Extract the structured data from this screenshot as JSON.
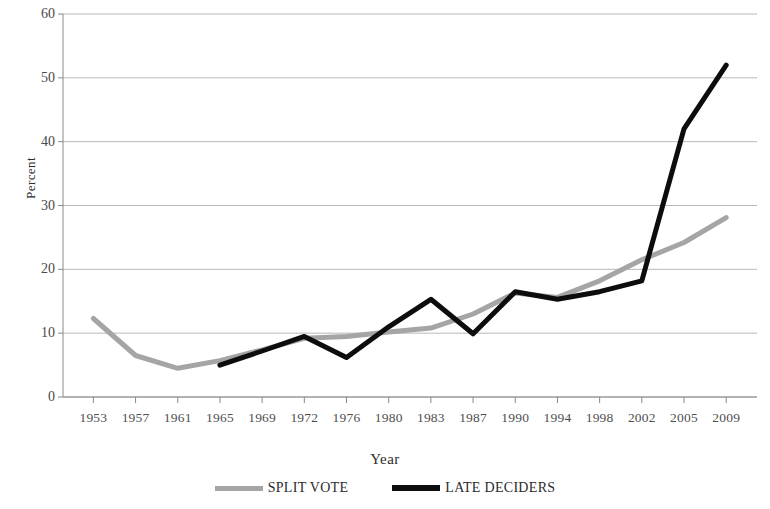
{
  "chart_data": {
    "type": "line",
    "title": "",
    "xlabel": "Year",
    "ylabel": "Percent",
    "ylim": [
      0,
      60
    ],
    "yticks": [
      0,
      10,
      20,
      30,
      40,
      50,
      60
    ],
    "grid": true,
    "legend_position": "bottom",
    "categories": [
      "1953",
      "1957",
      "1961",
      "1965",
      "1969",
      "1972",
      "1976",
      "1980",
      "1983",
      "1987",
      "1990",
      "1994",
      "1998",
      "2002",
      "2005",
      "2009"
    ],
    "series": [
      {
        "name": "SPLIT VOTE",
        "color": "#a5a5a5",
        "values": [
          12.3,
          6.5,
          4.5,
          5.7,
          7.4,
          9.2,
          9.5,
          10.2,
          10.8,
          13.0,
          16.3,
          15.6,
          18.2,
          21.5,
          24.2,
          28.1
        ]
      },
      {
        "name": "LATE DECIDERS",
        "color": "#0d0d0d",
        "values": [
          null,
          null,
          null,
          5.0,
          7.2,
          9.5,
          6.2,
          11.0,
          15.3,
          9.9,
          16.5,
          15.3,
          16.5,
          18.2,
          42.0,
          52.0
        ]
      }
    ]
  },
  "axes": {
    "y_title": "Percent",
    "x_title": "Year",
    "y_tick_labels": [
      "0",
      "10",
      "20",
      "30",
      "40",
      "50",
      "60"
    ],
    "x_tick_labels": [
      "1953",
      "1957",
      "1961",
      "1965",
      "1969",
      "1972",
      "1976",
      "1980",
      "1983",
      "1987",
      "1990",
      "1994",
      "1998",
      "2002",
      "2005",
      "2009"
    ]
  },
  "legend": {
    "items": [
      {
        "label": "SPLIT VOTE",
        "color": "#a5a5a5"
      },
      {
        "label": "LATE DECIDERS",
        "color": "#0d0d0d"
      }
    ]
  },
  "colors": {
    "split_vote": "#a5a5a5",
    "late_deciders": "#0d0d0d",
    "grid": "#b8b8b8",
    "axis": "#8a8a8a",
    "text": "#3a3a3a"
  }
}
